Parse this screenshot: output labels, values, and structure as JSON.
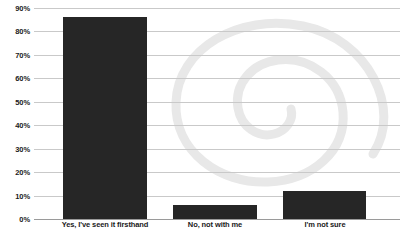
{
  "chart_data": {
    "type": "bar",
    "title": "",
    "xlabel": "",
    "ylabel": "",
    "categories": [
      "Yes, I've seen it firsthand",
      "No, not with me",
      "I'm not sure"
    ],
    "values": [
      86,
      6,
      12
    ],
    "ylim": [
      0,
      90
    ],
    "ytick_labels": [
      "90%",
      "80%",
      "70%",
      "60%",
      "50%",
      "40%",
      "30%",
      "20%",
      "10%",
      "0%"
    ],
    "ytick_values": [
      90,
      80,
      70,
      60,
      50,
      40,
      30,
      20,
      10,
      0
    ],
    "grid": true,
    "legend": "none",
    "bar_color": "#262626",
    "gridline_color": "#c9c9c9",
    "axis_color": "#9a9a9a",
    "background_color": "#ffffff",
    "watermark": {
      "name": "spiral-swirl-watermark",
      "color": "#e8e8e8"
    }
  }
}
